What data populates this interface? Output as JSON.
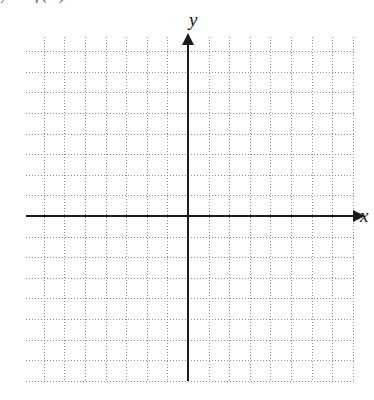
{
  "figure": {
    "kind": "blank-coordinate-grid",
    "title_fragment": "y = f(x)",
    "background_color": "#ffffff",
    "axis_color": "#1c1c1c",
    "grid_color": "#909090"
  },
  "axes": {
    "x_label": "x",
    "y_label": "y",
    "x_arrow_icon": "arrow-right-icon",
    "y_arrow_icon": "arrow-up-icon"
  },
  "chart_data": {
    "type": "scatter",
    "title": "",
    "subtitle": "",
    "xlabel": "x",
    "ylabel": "y",
    "series": [
      {
        "name": "plotted-data",
        "x": [],
        "y": []
      }
    ],
    "x": [],
    "values": [],
    "categories": [],
    "xlim": [
      -8,
      8
    ],
    "ylim": [
      -8,
      8
    ],
    "xticks": [],
    "yticks": [],
    "xticklabels": [],
    "yticklabels": [],
    "grid": true,
    "grid_style": "dotted",
    "grid_major_spacing_px": 20.6,
    "grid_minor_per_major": 1,
    "legend": false,
    "legend_position": "none",
    "annotations": []
  },
  "grid": {
    "left_px": 26,
    "top_px": 37,
    "width_px": 330,
    "height_px": 344,
    "origin_x_px": 188,
    "origin_y_px": 216,
    "columns": 16,
    "rows": 17
  }
}
